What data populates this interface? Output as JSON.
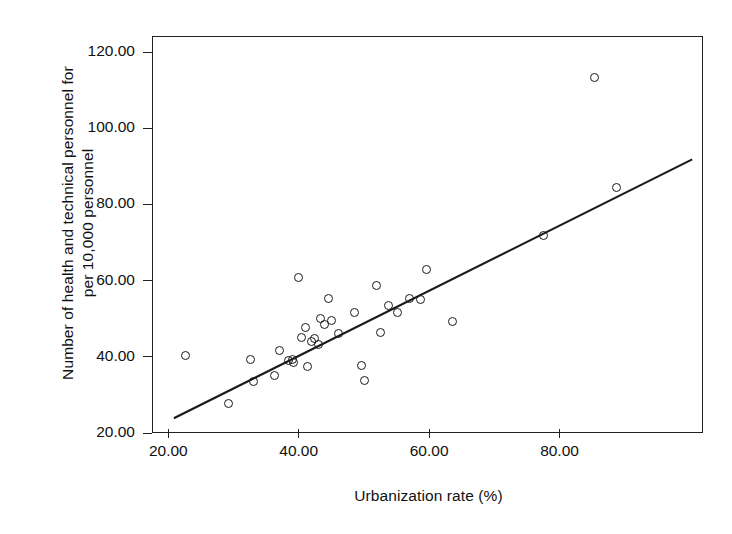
{
  "chart_data": {
    "type": "scatter",
    "title": "",
    "xlabel": "Urbanization rate (%)",
    "ylabel": "Number of health and technical personnel for\nper 10,000 personnel",
    "xlim": [
      17.5,
      102.0
    ],
    "ylim": [
      20.0,
      124.2
    ],
    "xticks": [
      20,
      40,
      60,
      80
    ],
    "xticklabels": [
      "20.00",
      "40.00",
      "60.00",
      "80.00"
    ],
    "yticks": [
      20,
      40,
      60,
      80,
      100,
      120
    ],
    "yticklabels": [
      "20.00",
      "40.00",
      "60.00",
      "80.00",
      "100.00",
      "120.00"
    ],
    "grid": false,
    "legend": null,
    "marker": "open-circle",
    "marker_color": "#1a1a1a",
    "line_color": "#1a1a1a",
    "points": [
      {
        "x": 22.6,
        "y": 40.4
      },
      {
        "x": 29.2,
        "y": 27.7
      },
      {
        "x": 32.6,
        "y": 39.4
      },
      {
        "x": 33.1,
        "y": 33.6
      },
      {
        "x": 36.3,
        "y": 35.0
      },
      {
        "x": 37.1,
        "y": 41.6
      },
      {
        "x": 38.4,
        "y": 38.9
      },
      {
        "x": 39.0,
        "y": 39.2
      },
      {
        "x": 39.2,
        "y": 38.5
      },
      {
        "x": 39.9,
        "y": 60.7
      },
      {
        "x": 40.4,
        "y": 45.0
      },
      {
        "x": 41.0,
        "y": 47.8
      },
      {
        "x": 41.3,
        "y": 37.5
      },
      {
        "x": 42.0,
        "y": 43.9
      },
      {
        "x": 42.4,
        "y": 44.7
      },
      {
        "x": 43.1,
        "y": 43.2
      },
      {
        "x": 43.4,
        "y": 50.0
      },
      {
        "x": 43.9,
        "y": 48.6
      },
      {
        "x": 44.6,
        "y": 55.4
      },
      {
        "x": 45.0,
        "y": 49.5
      },
      {
        "x": 46.1,
        "y": 46.2
      },
      {
        "x": 48.5,
        "y": 51.5
      },
      {
        "x": 49.7,
        "y": 37.7
      },
      {
        "x": 50.1,
        "y": 33.8
      },
      {
        "x": 51.9,
        "y": 58.6
      },
      {
        "x": 52.6,
        "y": 46.3
      },
      {
        "x": 53.8,
        "y": 53.4
      },
      {
        "x": 55.2,
        "y": 51.6
      },
      {
        "x": 57.0,
        "y": 55.4
      },
      {
        "x": 58.7,
        "y": 55.0
      },
      {
        "x": 59.6,
        "y": 62.9
      },
      {
        "x": 63.6,
        "y": 49.2
      },
      {
        "x": 77.5,
        "y": 71.8
      },
      {
        "x": 85.4,
        "y": 113.4
      },
      {
        "x": 88.8,
        "y": 84.5
      }
    ],
    "fit_line": {
      "label": "linear fit",
      "x_start": 21.0,
      "y_start": 24.0,
      "x_end": 100.2,
      "y_end": 91.7
    }
  },
  "axes": {
    "frame_name": "plot-frame"
  }
}
